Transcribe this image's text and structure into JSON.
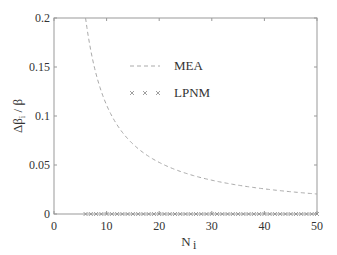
{
  "chart_data": {
    "type": "line",
    "title": "",
    "xlabel": "N_i",
    "ylabel": "Δβ_i / β",
    "xlim": [
      0,
      50
    ],
    "ylim": [
      0,
      0.2
    ],
    "xticks": [
      "0",
      "10",
      "20",
      "30",
      "40",
      "50"
    ],
    "yticks": [
      "0",
      "0.05",
      "0.1",
      "0.15",
      "0.2"
    ],
    "grid": false,
    "legend_position": "upper center",
    "series": [
      {
        "name": "MEA",
        "style": "dashed",
        "x": [
          6,
          7,
          8,
          9,
          10,
          12,
          14,
          16,
          18,
          20,
          25,
          30,
          35,
          40,
          45,
          50
        ],
        "values": [
          0.2,
          0.1667,
          0.1429,
          0.125,
          0.1111,
          0.0909,
          0.0769,
          0.0667,
          0.0588,
          0.0526,
          0.0417,
          0.0345,
          0.0294,
          0.0256,
          0.0227,
          0.0204
        ]
      },
      {
        "name": "LPNM",
        "style": "x-markers",
        "x_range": [
          6,
          50
        ],
        "values_constant": 0
      }
    ]
  },
  "labels": {
    "mea": "MEA",
    "lpnm": "LPNM",
    "xlabel_main": "N",
    "xlabel_sub": "i",
    "ylabel": "Δβ",
    "ylabel_sub": "i",
    "ylabel_tail": " / β"
  }
}
